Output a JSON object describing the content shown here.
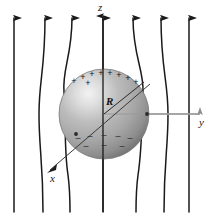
{
  "figure": {
    "background_color": "#ffffff",
    "width": 212,
    "height": 220
  },
  "axes": {
    "z": {
      "label": "z",
      "direction": "up",
      "x": 103,
      "tip_y": 14,
      "base_y": 212,
      "color": "#1a1a1a"
    },
    "y": {
      "label": "y",
      "direction": "right",
      "y": 114,
      "tip_x": 205,
      "base_x": 103,
      "color": "#9a9a9a"
    },
    "x": {
      "label": "x",
      "direction": "down-left",
      "tip_x": 47,
      "tip_y": 174,
      "base_x": 103,
      "base_y": 114,
      "color": "#3a3a3a"
    }
  },
  "sphere": {
    "label": "conducting-sphere",
    "center_x": 104,
    "center_y": 114,
    "radius": 45,
    "radius_label": "R",
    "highlight_color": "#f0f0f0",
    "mid_color": "#b2b2b2",
    "edge_color": "#6e6e6e"
  },
  "radius_line": {
    "label": "radius-indicator",
    "from_x": 104,
    "from_y": 114,
    "to_x": 144,
    "to_y": 82,
    "color": "#2a2a2a"
  },
  "charges": {
    "positive_symbol": "+",
    "negative_symbol": "–",
    "positive_count": 9,
    "negative_count": 8,
    "positive": [
      {
        "x": 74,
        "y": 84
      },
      {
        "x": 83,
        "y": 80
      },
      {
        "x": 92,
        "y": 77
      },
      {
        "x": 101,
        "y": 76
      },
      {
        "x": 110,
        "y": 76
      },
      {
        "x": 119,
        "y": 78
      },
      {
        "x": 128,
        "y": 81
      },
      {
        "x": 136,
        "y": 85
      },
      {
        "x": 88,
        "y": 86
      }
    ],
    "negative": [
      {
        "x": 78,
        "y": 141
      },
      {
        "x": 90,
        "y": 139
      },
      {
        "x": 104,
        "y": 138
      },
      {
        "x": 118,
        "y": 139
      },
      {
        "x": 130,
        "y": 141
      },
      {
        "x": 86,
        "y": 149
      },
      {
        "x": 104,
        "y": 148
      },
      {
        "x": 122,
        "y": 149
      }
    ]
  },
  "field_lines": {
    "label": "electric-field-lines",
    "count": 7,
    "color": "#1a1a1a",
    "arrow_y": 32,
    "top_y": 14,
    "bottom_y": 212,
    "lines": [
      {
        "id": 1,
        "top_x": 14,
        "bottom_x": 14,
        "bend": 0,
        "arrow": true
      },
      {
        "id": 2,
        "top_x": 45,
        "bottom_x": 43,
        "bend": 6,
        "arrow": true
      },
      {
        "id": 3,
        "top_x": 72,
        "bottom_x": 70,
        "bend": 18,
        "arrow": true
      },
      {
        "id": 4,
        "top_x": 103,
        "bottom_x": 103,
        "bend": 0,
        "arrow": true
      },
      {
        "id": 5,
        "top_x": 133,
        "bottom_x": 136,
        "bend": -18,
        "arrow": true
      },
      {
        "id": 6,
        "top_x": 161,
        "bottom_x": 164,
        "bend": -6,
        "arrow": true
      },
      {
        "id": 7,
        "top_x": 189,
        "bottom_x": 189,
        "bend": 0,
        "arrow": true
      }
    ]
  },
  "markers": {
    "y_axis_dot": {
      "x": 147,
      "y": 114
    },
    "x_axis_dot": {
      "x": 76,
      "y": 134
    }
  }
}
